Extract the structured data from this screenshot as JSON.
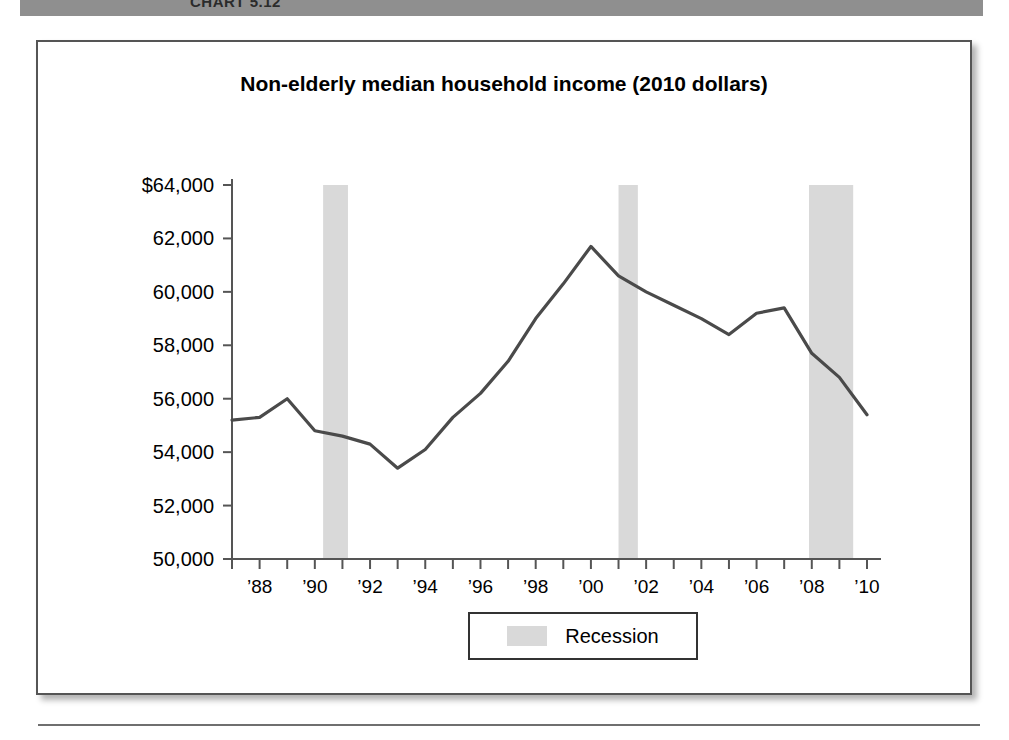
{
  "page": {
    "header_bar_label": "CHART 5.12",
    "footer_divider": "horizontal-rule"
  },
  "figure": {
    "title": "Non-elderly median household income (2010 dollars)",
    "legend": {
      "swatch_color": "#d9d9d9",
      "label": "Recession"
    }
  },
  "chart_data": {
    "type": "line",
    "title": "Non-elderly median household income (2010 dollars)",
    "xlabel": "",
    "ylabel": "",
    "grid": false,
    "legend_position": "bottom-center",
    "xlim": [
      1987,
      2010
    ],
    "ylim": [
      50000,
      64000
    ],
    "y_tick_values": [
      64000,
      62000,
      60000,
      58000,
      56000,
      54000,
      52000,
      50000
    ],
    "y_tick_labels": [
      "$64,000",
      "62,000",
      "60,000",
      "58,000",
      "56,000",
      "54,000",
      "52,000",
      "50,000"
    ],
    "x_tick_values": [
      1988,
      1990,
      1992,
      1994,
      1996,
      1998,
      2000,
      2002,
      2004,
      2006,
      2008,
      2010
    ],
    "x_tick_labels": [
      "’88",
      "’90",
      "’92",
      "’94",
      "’96",
      "’98",
      "’00",
      "’02",
      "’04",
      "’06",
      "’08",
      "’10"
    ],
    "x_minor_ticks_every": 1,
    "series": [
      {
        "name": "Non-elderly median household income (2010 dollars)",
        "color": "#4a4a4a",
        "x": [
          1987,
          1988,
          1989,
          1990,
          1991,
          1992,
          1993,
          1994,
          1995,
          1996,
          1997,
          1998,
          1999,
          2000,
          2001,
          2002,
          2003,
          2004,
          2005,
          2006,
          2007,
          2008,
          2009,
          2010
        ],
        "values": [
          55200,
          55300,
          56000,
          54800,
          54600,
          54300,
          53400,
          54100,
          55300,
          56200,
          57400,
          59000,
          60300,
          61700,
          60600,
          60000,
          59500,
          59000,
          58400,
          59200,
          59400,
          57700,
          56800,
          55400
        ]
      }
    ],
    "shaded_regions": [
      {
        "label": "Recession",
        "x_start": 1990.3,
        "x_end": 1991.2,
        "color": "#d9d9d9"
      },
      {
        "label": "Recession",
        "x_start": 2001.0,
        "x_end": 2001.7,
        "color": "#d9d9d9"
      },
      {
        "label": "Recession",
        "x_start": 2007.9,
        "x_end": 2009.5,
        "color": "#d9d9d9"
      }
    ]
  }
}
